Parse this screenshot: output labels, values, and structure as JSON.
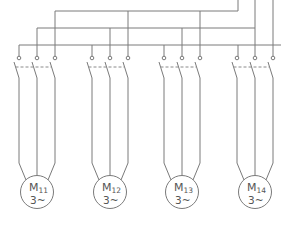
{
  "diagram": {
    "type": "electrical-schematic",
    "colors": {
      "line": "#7a7a7a",
      "text": "#555555",
      "background": "#ffffff"
    },
    "bus": {
      "phases": [
        {
          "name": "L1",
          "y": 11
        },
        {
          "name": "L2",
          "y": 28
        },
        {
          "name": "L3",
          "y": 45
        }
      ]
    },
    "motors": [
      {
        "id": "M11",
        "label": "M",
        "sub": "11",
        "type": "3~",
        "cx": 37,
        "poles": [
          19,
          37,
          55
        ]
      },
      {
        "id": "M12",
        "label": "M",
        "sub": "12",
        "type": "3~",
        "cx": 110,
        "poles": [
          92,
          110,
          128
        ]
      },
      {
        "id": "M13",
        "label": "M",
        "sub": "13",
        "type": "3~",
        "cx": 182,
        "poles": [
          164,
          182,
          200
        ]
      },
      {
        "id": "M14",
        "label": "M",
        "sub": "14",
        "type": "3~",
        "cx": 255,
        "poles": [
          237,
          255,
          273
        ]
      }
    ]
  }
}
